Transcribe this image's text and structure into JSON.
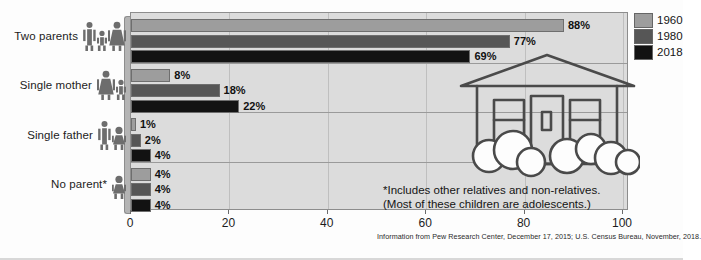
{
  "chart_data": {
    "type": "bar",
    "orientation": "horizontal",
    "title": "",
    "xlabel": "",
    "ylabel": "",
    "categories": [
      "Two parents",
      "Single mother",
      "Single father",
      "No parent*"
    ],
    "category_icons": [
      "man-child-woman-icon",
      "woman-child-icon",
      "child-man-icon",
      "child-icon"
    ],
    "series": [
      {
        "name": "1960",
        "color": "#9d9d9d",
        "values": [
          88,
          8,
          1,
          4
        ]
      },
      {
        "name": "1980",
        "color": "#565656",
        "values": [
          77,
          18,
          2,
          4
        ]
      },
      {
        "name": "2018",
        "color": "#121212",
        "values": [
          69,
          22,
          4,
          4
        ]
      }
    ],
    "value_labels": [
      [
        "88%",
        "8%",
        "1%",
        "4%"
      ],
      [
        "77%",
        "18%",
        "2%",
        "4%"
      ],
      [
        "69%",
        "22%",
        "4%",
        "4%"
      ]
    ],
    "xlim": [
      0,
      100
    ],
    "xticks": [
      0,
      20,
      40,
      60,
      80,
      100
    ],
    "xtick_labels": [
      "0",
      "20",
      "40",
      "60",
      "80",
      "100"
    ],
    "grid": true,
    "legend_position": "right-top",
    "annotations": [
      "*Includes other relatives and non-relatives.",
      "(Most of these children are adolescents.)"
    ],
    "source": "Information from Pew Research Center, December 17, 2015; U.S. Census Bureau, November, 2018."
  },
  "legend": {
    "entries": [
      {
        "label": "1960",
        "color": "#9d9d9d"
      },
      {
        "label": "1980",
        "color": "#565656"
      },
      {
        "label": "2018",
        "color": "#121212"
      }
    ]
  },
  "decor": {
    "house_illustration": "house-outline-illustration"
  }
}
